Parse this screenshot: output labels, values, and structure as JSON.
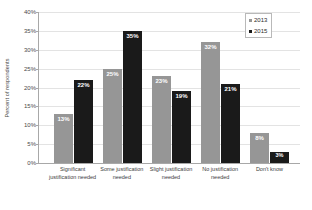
{
  "chart_data": {
    "type": "bar",
    "title": "",
    "xlabel": "",
    "ylabel": "Percent of respondents",
    "ylim": [
      0,
      40
    ],
    "ytick_labels": [
      "40%",
      "35%",
      "30%",
      "25%",
      "20%",
      "15%",
      "10%",
      "5%",
      "0%"
    ],
    "ytick_values": [
      40,
      35,
      30,
      25,
      20,
      15,
      10,
      5,
      0
    ],
    "grid": true,
    "legend_position": "top-right",
    "categories": [
      "Significant justification needed",
      "Some justification needed",
      "Slight justification needed",
      "No justification needed",
      "Don't know"
    ],
    "series": [
      {
        "name": "2013",
        "color": "#969696",
        "values": [
          13,
          25,
          23,
          32,
          8
        ],
        "data_labels": [
          "13%",
          "25%",
          "23%",
          "32%",
          "8%"
        ]
      },
      {
        "name": "2015",
        "color": "#1a1a1a",
        "values": [
          22,
          35,
          19,
          21,
          3
        ],
        "data_labels": [
          "22%",
          "35%",
          "19%",
          "21%",
          "3%"
        ]
      }
    ]
  },
  "legend": {
    "items": [
      {
        "label": "2013",
        "series_key": "s2013"
      },
      {
        "label": "2015",
        "series_key": "s2015"
      }
    ]
  },
  "colors": {
    "series_2013": "#969696",
    "series_2015": "#1a1a1a",
    "gridline": "#e3e3e3",
    "axis": "#a8a8a8",
    "data_label_text": "#ffffff"
  }
}
